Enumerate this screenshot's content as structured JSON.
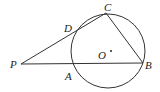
{
  "diagram": {
    "type": "geometry",
    "points": {
      "P": "P",
      "A": "A",
      "B": "B",
      "C": "C",
      "D": "D",
      "O": "O"
    },
    "segments": [
      "PB",
      "PC",
      "CB"
    ],
    "circle": {
      "center": "O"
    }
  }
}
